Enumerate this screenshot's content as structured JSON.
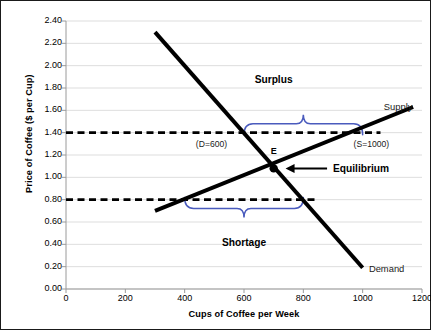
{
  "chart_data": {
    "type": "line",
    "title": "",
    "xlabel": "Cups of Coffee per Week",
    "ylabel": "Price of Coffee ($ per Cup)",
    "xlim": [
      0,
      1200
    ],
    "ylim": [
      0.0,
      2.4
    ],
    "xticks": [
      "0",
      "200",
      "400",
      "600",
      "800",
      "1000",
      "1200"
    ],
    "xtick_values": [
      0,
      200,
      400,
      600,
      800,
      1000,
      1200
    ],
    "yticks": [
      "0.00",
      "0.20",
      "0.40",
      "0.60",
      "0.80",
      "1.00",
      "1.20",
      "1.40",
      "1.60",
      "1.80",
      "2.00",
      "2.20",
      "2.40"
    ],
    "ytick_values": [
      0.0,
      0.2,
      0.4,
      0.6,
      0.8,
      1.0,
      1.2,
      1.4,
      1.6,
      1.8,
      2.0,
      2.2,
      2.4
    ],
    "grid": true,
    "grid_axis": "y",
    "legend": "none",
    "series": [
      {
        "name": "Demand",
        "label": "Demand",
        "color": "#000000",
        "width": 4,
        "points": [
          [
            300,
            2.3
          ],
          [
            1000,
            0.19
          ]
        ]
      },
      {
        "name": "Supply",
        "label": "Supply",
        "color": "#000000",
        "width": 4,
        "points": [
          [
            300,
            0.7
          ],
          [
            1170,
            1.63
          ]
        ]
      }
    ],
    "reference_lines": [
      {
        "name": "surplus-price-line",
        "axis": "y",
        "value": 1.4,
        "style": "dashed",
        "color": "#000000",
        "x_from": 0,
        "x_to": 1060
      },
      {
        "name": "shortage-price-line",
        "axis": "y",
        "value": 0.8,
        "style": "dashed",
        "color": "#000000",
        "x_from": 0,
        "x_to": 840
      }
    ],
    "markers": [
      {
        "name": "equilibrium-point",
        "x": 700,
        "y": 1.08,
        "label": "E",
        "color": "#000000"
      }
    ],
    "annotations": [
      {
        "name": "surplus-label",
        "text": "Surplus",
        "x": 700,
        "y": 1.86,
        "style": "bold"
      },
      {
        "name": "shortage-label",
        "text": "Shortage",
        "x": 600,
        "y": 0.4,
        "style": "bold"
      },
      {
        "name": "equilibrium-label",
        "text": "Equilibrium",
        "x": 900,
        "y": 1.07,
        "style": "bold"
      },
      {
        "name": "equilibrium-point-label",
        "text": "E",
        "x": 700,
        "y": 1.22,
        "style": "bold-small"
      },
      {
        "name": "demand-quantity-label",
        "text": "(D=600)",
        "x": 490,
        "y": 1.28,
        "style": "light"
      },
      {
        "name": "supply-quantity-label",
        "text": "(S=1000)",
        "x": 1030,
        "y": 1.28,
        "style": "light"
      },
      {
        "name": "supply-series-label",
        "text": "Supply",
        "x": 1120,
        "y": 1.62,
        "style": "series"
      },
      {
        "name": "demand-series-label",
        "text": "Demand",
        "x": 1080,
        "y": 0.17,
        "style": "series"
      }
    ],
    "braces": [
      {
        "name": "surplus-brace",
        "text": "Surplus",
        "orientation": "up",
        "x_from": 600,
        "x_to": 1000,
        "y": 1.48,
        "color": "#4a5bbd"
      },
      {
        "name": "shortage-brace",
        "text": "Shortage",
        "orientation": "down",
        "x_from": 400,
        "x_to": 800,
        "y": 0.72,
        "color": "#4a5bbd"
      }
    ],
    "arrow": {
      "name": "equilibrium-arrow",
      "from": [
        880,
        1.08
      ],
      "to": [
        740,
        1.08
      ],
      "color": "#000000"
    },
    "colors": {
      "curve": "#000000",
      "brace": "#4a5bbd",
      "grid": "#d4d4d4",
      "axis": "#9a9a9a",
      "border": "#1a1a1a",
      "background": "#ffffff"
    }
  },
  "axes": {
    "y_title": "Price of Coffee ($ per Cup)",
    "x_title": "Cups of Coffee per Week"
  },
  "labels": {
    "surplus": "Surplus",
    "shortage": "Shortage",
    "equilibrium": "Equilibrium",
    "e_point": "E",
    "demand_qty": "(D=600)",
    "supply_qty": "(S=1000)",
    "supply": "Supply",
    "demand": "Demand"
  }
}
